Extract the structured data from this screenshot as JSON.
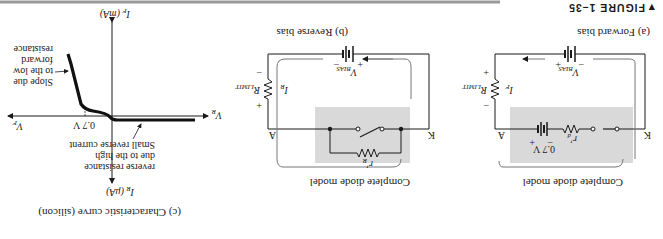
{
  "figure": {
    "marker": "▼",
    "label": "FIGURE 1–35"
  },
  "panel_a": {
    "caption": "(a) Forward bias",
    "model_label": "Complete diode model",
    "node_a": "A",
    "node_k": "K",
    "source_label": "V",
    "source_sub": "BIAS",
    "source_plus": "+",
    "source_minus": "−",
    "resistor_label": "R",
    "resistor_sub": "LIMIT",
    "res_plus": "+",
    "res_minus": "−",
    "current_label": "I",
    "current_sub": "F",
    "barrier_label": "0.7 V",
    "barrier_plus": "+",
    "barrier_minus": "−",
    "internal_r": "r′",
    "internal_r_sub": "d"
  },
  "panel_b": {
    "caption": "(b) Reverse bias",
    "model_label": "Complete diode model",
    "node_a": "A",
    "node_k": "K",
    "source_label": "V",
    "source_sub": "BIAS",
    "source_plus": "+",
    "source_minus": "−",
    "resistor_label": "R",
    "resistor_sub": "LIMIT",
    "res_plus": "+",
    "res_minus": "−",
    "current_label": "I",
    "current_sub": "R",
    "internal_r": "r′",
    "internal_r_sub": "R"
  },
  "panel_c": {
    "caption": "(c) Characteristic curve (silicon)",
    "axis_if": "I",
    "axis_if_sub": "F",
    "axis_if_unit": " (mA)",
    "axis_ir": "I",
    "axis_ir_sub": "R",
    "axis_ir_unit": " (μA)",
    "axis_vf": "V",
    "axis_vf_sub": "F",
    "axis_vr": "V",
    "axis_vr_sub": "R",
    "knee_label": "0.7 V",
    "annotation_forward": [
      "Slope due",
      "to the low",
      "forward",
      "resistance"
    ],
    "annotation_reverse": [
      "Small reverse current",
      "due to the high",
      "reverse resistance"
    ]
  }
}
